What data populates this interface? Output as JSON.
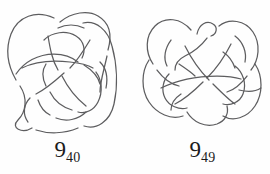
{
  "figure": {
    "kind": "knot-diagram-plate",
    "background_color": "#fefefe",
    "stroke_color": "#5d5d5f",
    "label_color": "#1b1b1b",
    "knots": [
      {
        "id": "knot-9-40",
        "label_main": "9",
        "label_subscript": "40",
        "label_full": "9_40",
        "crossing_number": 9,
        "table_index": 40
      },
      {
        "id": "knot-9-49",
        "label_main": "9",
        "label_subscript": "49",
        "label_full": "9_49",
        "crossing_number": 9,
        "table_index": 49
      }
    ]
  }
}
